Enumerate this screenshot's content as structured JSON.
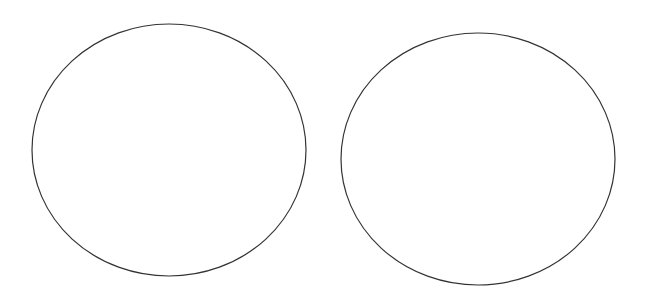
{
  "canvas": {
    "width": 646,
    "height": 298,
    "background": "#ffffff"
  },
  "shapes": [
    {
      "type": "ellipse",
      "cx": 169,
      "cy": 150,
      "rx": 137,
      "ry": 126,
      "stroke": "#333333",
      "stroke_width": 1.2,
      "fill": "none"
    },
    {
      "type": "ellipse",
      "cx": 478,
      "cy": 159,
      "rx": 137,
      "ry": 126,
      "stroke": "#333333",
      "stroke_width": 1.2,
      "fill": "none"
    }
  ]
}
